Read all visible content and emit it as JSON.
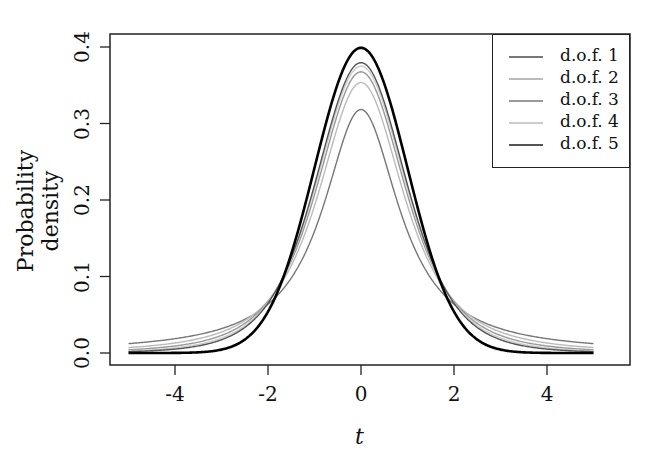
{
  "chart_data": {
    "type": "line",
    "title": "",
    "xlabel": "t",
    "ylabel": "Probability density",
    "xlim": [
      -5,
      5
    ],
    "ylim": [
      0,
      0.4
    ],
    "x_ticks": [
      "-4",
      "-2",
      "0",
      "2",
      "4"
    ],
    "y_ticks": [
      "0.0",
      "0.1",
      "0.2",
      "0.3",
      "0.4"
    ],
    "grid": false,
    "legend_position": "top-right",
    "series": [
      {
        "name": "d.o.f. 1",
        "dof": 1,
        "color": "#777777",
        "peak": 0.318
      },
      {
        "name": "d.o.f. 2",
        "dof": 2,
        "color": "#bbbbbb",
        "peak": 0.354
      },
      {
        "name": "d.o.f. 3",
        "dof": 3,
        "color": "#999999",
        "peak": 0.368
      },
      {
        "name": "d.o.f. 4",
        "dof": 4,
        "color": "#cccccc",
        "peak": 0.375
      },
      {
        "name": "d.o.f. 5",
        "dof": 5,
        "color": "#555555",
        "peak": 0.38
      },
      {
        "name": "",
        "dof": null,
        "color": "#000000",
        "peak": 0.399,
        "note": "standard normal (thick, not in legend)"
      }
    ]
  },
  "legend": {
    "items": [
      {
        "label": "d.o.f. 1",
        "color": "#777777"
      },
      {
        "label": "d.o.f. 2",
        "color": "#bbbbbb"
      },
      {
        "label": "d.o.f. 3",
        "color": "#999999"
      },
      {
        "label": "d.o.f. 4",
        "color": "#cccccc"
      },
      {
        "label": "d.o.f. 5",
        "color": "#555555"
      }
    ]
  },
  "axes": {
    "xlabel": "t",
    "ylabel": "Probability density",
    "x_ticks": [
      {
        "label": "-4",
        "value": -4
      },
      {
        "label": "-2",
        "value": -2
      },
      {
        "label": "0",
        "value": 0
      },
      {
        "label": "2",
        "value": 2
      },
      {
        "label": "4",
        "value": 4
      }
    ],
    "y_ticks": [
      {
        "label": "0.0",
        "value": 0.0
      },
      {
        "label": "0.1",
        "value": 0.1
      },
      {
        "label": "0.2",
        "value": 0.2
      },
      {
        "label": "0.3",
        "value": 0.3
      },
      {
        "label": "0.4",
        "value": 0.4
      }
    ]
  }
}
